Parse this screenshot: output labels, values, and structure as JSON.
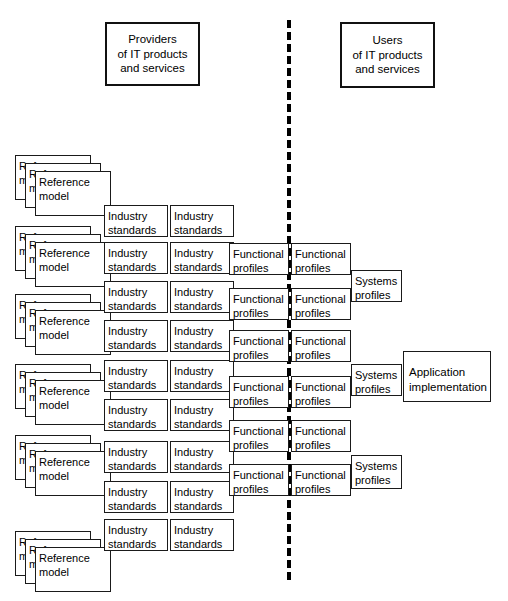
{
  "diagram": {
    "title_provider": "Providers\nof IT products\nand services",
    "title_user": "Users\nof IT products\nand services",
    "label_reference_model": "Reference\nmodel",
    "label_industry_standards": "Industry\nstandards",
    "label_functional_profiles": "Functional\nprofiles",
    "label_systems_profiles": "Systems\nprofiles",
    "label_application_implementation": "Application\nimplementation",
    "divider_style": "dashed-vertical",
    "colors": {
      "background": "#ffffff",
      "box_border": "#1a1a1a",
      "header_border": "#111111",
      "text": "#000000",
      "divider": "#000000"
    },
    "counts": {
      "reference_model_stacks": 6,
      "reference_model_layers_per_stack": 3,
      "industry_standards_rows": 9,
      "industry_standards_columns": 2,
      "functional_profiles_rows": 6,
      "functional_profiles_columns": 2,
      "systems_profiles": 3,
      "application_implementation": 1
    }
  }
}
